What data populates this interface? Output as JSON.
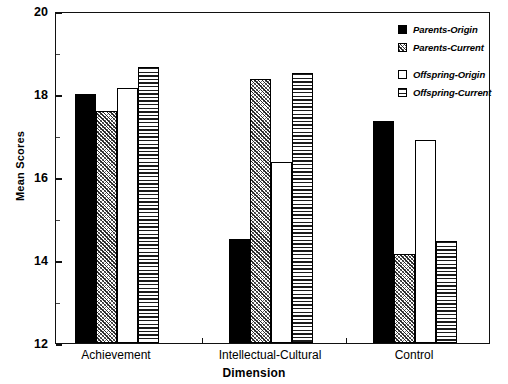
{
  "chart_data": {
    "type": "bar",
    "title": "",
    "xlabel": "Dimension",
    "ylabel": "Mean Scores",
    "categories": [
      "Achievement",
      "Intellectual-Cultural",
      "Control"
    ],
    "series": [
      {
        "name": "Parents-Origin",
        "pattern": "solid",
        "values": [
          18.0,
          14.5,
          17.35
        ]
      },
      {
        "name": "Parents-Current",
        "pattern": "diagonal",
        "values": [
          17.6,
          18.35,
          14.15
        ]
      },
      {
        "name": "Offspring-Origin",
        "pattern": "open",
        "values": [
          18.15,
          16.35,
          16.9
        ]
      },
      {
        "name": "Offspring-Current",
        "pattern": "horizontal",
        "values": [
          18.65,
          18.5,
          14.45
        ]
      }
    ],
    "ylim": [
      12,
      20
    ],
    "ytick_labels": [
      "12",
      "14",
      "16",
      "18",
      "20"
    ],
    "ytick_values": [
      12,
      14,
      16,
      18,
      20
    ],
    "yminor_values": [
      13,
      15,
      17,
      19
    ],
    "grid": false,
    "legend_position": "top-right",
    "frame": true,
    "colors": {
      "axis": "#111111",
      "bar_edge": "#000000",
      "solid_fill": "#000000",
      "open_fill": "#ffffff",
      "background": "#ffffff"
    }
  }
}
